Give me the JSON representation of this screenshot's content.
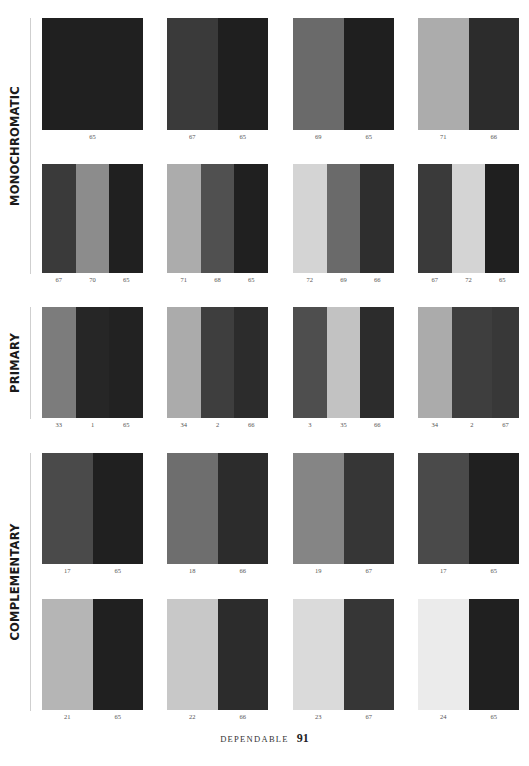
{
  "sections": [
    {
      "label": "MONOCHROMATIC",
      "label_top": 18,
      "label_height": 256
    },
    {
      "label": "PRIMARY",
      "label_top": 307,
      "label_height": 112
    },
    {
      "label": "COMPLEMENTARY",
      "label_top": 453,
      "label_height": 258
    }
  ],
  "layout": {
    "columns_x": [
      42,
      167,
      293,
      418
    ],
    "rows": [
      {
        "top": 18,
        "height": 112
      },
      {
        "top": 164,
        "height": 109
      },
      {
        "top": 307,
        "height": 111
      },
      {
        "top": 453,
        "height": 111
      },
      {
        "top": 599,
        "height": 111
      }
    ]
  },
  "swatches": [
    [
      {
        "stripes": [
          {
            "num": "65",
            "color": "#202020"
          }
        ]
      },
      {
        "stripes": [
          {
            "num": "67",
            "color": "#3a3a3a"
          },
          {
            "num": "65",
            "color": "#1f1f1f"
          }
        ]
      },
      {
        "stripes": [
          {
            "num": "69",
            "color": "#6a6a6a"
          },
          {
            "num": "65",
            "color": "#1f1f1f"
          }
        ]
      },
      {
        "stripes": [
          {
            "num": "71",
            "color": "#acacac"
          },
          {
            "num": "66",
            "color": "#2c2c2c"
          }
        ]
      }
    ],
    [
      {
        "stripes": [
          {
            "num": "67",
            "color": "#3a3a3a"
          },
          {
            "num": "70",
            "color": "#8c8c8c"
          },
          {
            "num": "65",
            "color": "#202020"
          }
        ]
      },
      {
        "stripes": [
          {
            "num": "71",
            "color": "#acacac"
          },
          {
            "num": "68",
            "color": "#505050"
          },
          {
            "num": "65",
            "color": "#202020"
          }
        ]
      },
      {
        "stripes": [
          {
            "num": "72",
            "color": "#d4d4d4"
          },
          {
            "num": "69",
            "color": "#6a6a6a"
          },
          {
            "num": "66",
            "color": "#2e2e2e"
          }
        ]
      },
      {
        "stripes": [
          {
            "num": "67",
            "color": "#3a3a3a"
          },
          {
            "num": "72",
            "color": "#d4d4d4"
          },
          {
            "num": "65",
            "color": "#1f1f1f"
          }
        ]
      }
    ],
    [
      {
        "stripes": [
          {
            "num": "33",
            "color": "#7c7c7c"
          },
          {
            "num": "1",
            "color": "#262626"
          },
          {
            "num": "65",
            "color": "#222222"
          }
        ]
      },
      {
        "stripes": [
          {
            "num": "34",
            "color": "#ababab"
          },
          {
            "num": "2",
            "color": "#3e3e3e"
          },
          {
            "num": "66",
            "color": "#2c2c2c"
          }
        ]
      },
      {
        "stripes": [
          {
            "num": "3",
            "color": "#4e4e4e"
          },
          {
            "num": "35",
            "color": "#c2c2c2"
          },
          {
            "num": "66",
            "color": "#2c2c2c"
          }
        ]
      },
      {
        "stripes": [
          {
            "num": "34",
            "color": "#ababab"
          },
          {
            "num": "2",
            "color": "#3e3e3e"
          },
          {
            "num": "67",
            "color": "#383838"
          }
        ],
        "widths": [
          1,
          1.2,
          0.8
        ]
      }
    ],
    [
      {
        "stripes": [
          {
            "num": "17",
            "color": "#4a4a4a"
          },
          {
            "num": "65",
            "color": "#202020"
          }
        ]
      },
      {
        "stripes": [
          {
            "num": "18",
            "color": "#6e6e6e"
          },
          {
            "num": "66",
            "color": "#2c2c2c"
          }
        ]
      },
      {
        "stripes": [
          {
            "num": "19",
            "color": "#858585"
          },
          {
            "num": "67",
            "color": "#363636"
          }
        ]
      },
      {
        "stripes": [
          {
            "num": "17",
            "color": "#4a4a4a"
          },
          {
            "num": "65",
            "color": "#202020"
          }
        ]
      }
    ],
    [
      {
        "stripes": [
          {
            "num": "21",
            "color": "#b5b5b5"
          },
          {
            "num": "65",
            "color": "#202020"
          }
        ]
      },
      {
        "stripes": [
          {
            "num": "22",
            "color": "#c8c8c8"
          },
          {
            "num": "66",
            "color": "#2c2c2c"
          }
        ]
      },
      {
        "stripes": [
          {
            "num": "23",
            "color": "#dadada"
          },
          {
            "num": "67",
            "color": "#363636"
          }
        ]
      },
      {
        "stripes": [
          {
            "num": "24",
            "color": "#ebebeb"
          },
          {
            "num": "65",
            "color": "#202020"
          }
        ]
      }
    ]
  ],
  "footer": {
    "word": "DEPENDABLE",
    "page": "91"
  }
}
